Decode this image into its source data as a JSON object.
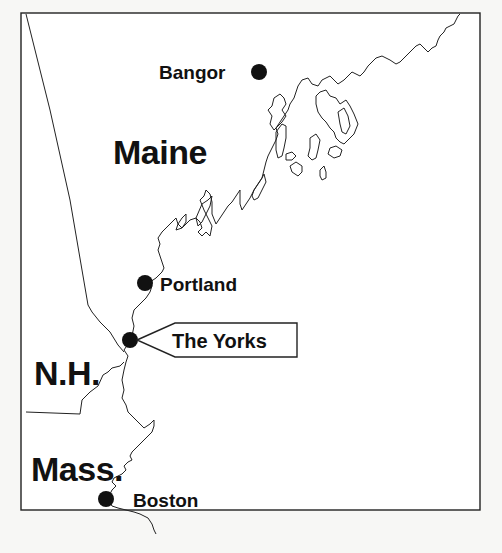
{
  "map": {
    "title": "",
    "region": "New England coast",
    "states": [
      {
        "id": "maine",
        "label": "Maine"
      },
      {
        "id": "nh",
        "label": "N.H."
      },
      {
        "id": "mass",
        "label": "Mass."
      }
    ],
    "cities": [
      {
        "id": "bangor",
        "label": "Bangor"
      },
      {
        "id": "portland",
        "label": "Portland"
      },
      {
        "id": "the-yorks",
        "label": "The Yorks",
        "highlighted": true
      },
      {
        "id": "boston",
        "label": "Boston"
      }
    ],
    "colors": {
      "background": "#ffffff",
      "page": "#f7f7f5",
      "ink": "#111111",
      "line": "#222222"
    }
  }
}
